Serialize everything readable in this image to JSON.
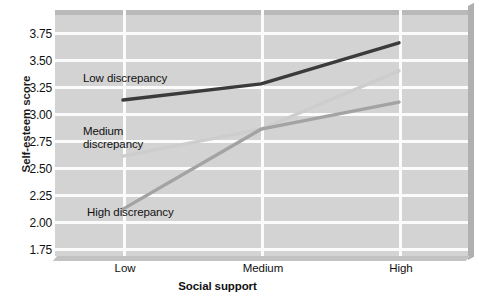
{
  "chart_data": {
    "type": "line",
    "title": "",
    "xlabel": "Social support",
    "ylabel": "Self-esteem score",
    "categories": [
      "Low",
      "Medium",
      "High"
    ],
    "x": [
      0,
      1,
      2
    ],
    "ylim": [
      1.75,
      3.75
    ],
    "yticks": [
      "3.75",
      "3.50",
      "3.25",
      "3.00",
      "2.75",
      "2.50",
      "2.25",
      "2.00",
      "1.75"
    ],
    "ytick_values": [
      3.75,
      3.5,
      3.25,
      3.0,
      2.75,
      2.5,
      2.25,
      2.0,
      1.75
    ],
    "grid": true,
    "legend_position": "inline-annotations",
    "series": [
      {
        "name": "Low discrepancy",
        "label": "Low discrepancy",
        "values": [
          3.12,
          3.27,
          3.65
        ],
        "color": "#3b3b3b",
        "width": 3.4
      },
      {
        "name": "Medium discrepancy",
        "label": "Medium\ndiscrepancy",
        "values": [
          2.6,
          2.85,
          3.39
        ],
        "color": "#cdcdcd",
        "width": 3.4
      },
      {
        "name": "High discrepancy",
        "label": "High discrepancy",
        "values": [
          2.11,
          2.85,
          3.1
        ],
        "color": "#a3a3a3",
        "width": 3.4
      }
    ],
    "annotations": [
      {
        "text": "Low discrepancy",
        "x": 0.06,
        "y": 3.36
      },
      {
        "text": "Medium\ndiscrepancy",
        "x": 0.06,
        "y": 2.99
      },
      {
        "text": "High discrepancy",
        "x": 0.08,
        "y": 2.02
      }
    ],
    "colors": {
      "panel_background": "#d3d3d3",
      "gridline": "#fbfbfb",
      "page_background": "#ffffff",
      "text": "#111111",
      "low_discrepancy": "#3b3b3b",
      "medium_discrepancy": "#cdcdcd",
      "high_discrepancy": "#a3a3a3"
    }
  }
}
